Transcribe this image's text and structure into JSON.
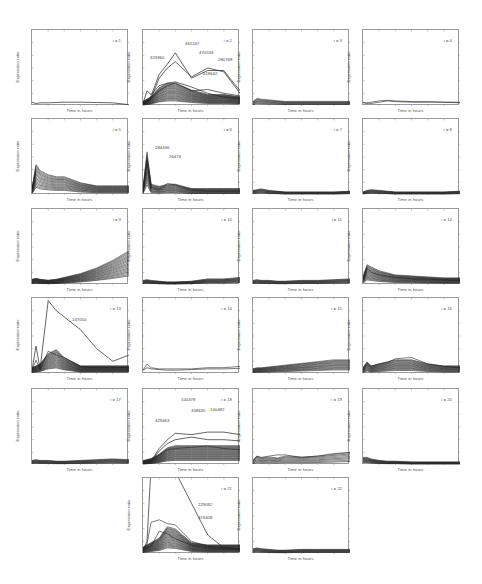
{
  "figure": {
    "ylabel": "Expression ratio",
    "xlabel": "Time in hours"
  },
  "chart_data": [
    {
      "type": "line",
      "title": "i = 1",
      "xlabel": "Time in hours",
      "ylabel": "Expression ratio",
      "ylim": [
        0,
        6
      ],
      "grid": false,
      "annotations": [],
      "series_desc": "single near-flat profile ~0.3"
    },
    {
      "type": "line",
      "title": "i = 2",
      "xlabel": "Time in hours",
      "ylabel": "Expression ratio",
      "ylim": [
        0,
        6
      ],
      "grid": false,
      "annotations": [
        "323960",
        "361247",
        "470534",
        "280768",
        "618642"
      ],
      "series_desc": "dense bundle rising to peak ~hour 3 then declining; outliers peaking ~4.2"
    },
    {
      "type": "line",
      "title": "i = 3",
      "xlabel": "Time in hours",
      "ylabel": "Expression ratio",
      "ylim": [
        0,
        6
      ],
      "grid": false,
      "annotations": [],
      "series_desc": "flat bundle ~0.3"
    },
    {
      "type": "line",
      "title": "i = 4",
      "xlabel": "Time in hours",
      "ylabel": "Expression ratio",
      "ylim": [
        0,
        6
      ],
      "grid": false,
      "annotations": [],
      "series_desc": "flat ~0.3"
    },
    {
      "type": "line",
      "title": "i = 5",
      "xlabel": "Time in hours",
      "ylabel": "Expression ratio",
      "ylim": [
        0,
        6
      ],
      "grid": false,
      "annotations": [],
      "series_desc": "early peak ~1.5 then decay"
    },
    {
      "type": "line",
      "title": "i = 6",
      "xlabel": "Time in hours",
      "ylabel": "Expression ratio",
      "ylim": [
        0,
        6
      ],
      "grid": false,
      "annotations": [
        "284436",
        "26474"
      ],
      "series_desc": "sharp early spike ~2.5 then flat"
    },
    {
      "type": "line",
      "title": "i = 7",
      "xlabel": "Time in hours",
      "ylabel": "Expression ratio",
      "ylim": [
        0,
        6
      ],
      "grid": false,
      "annotations": [],
      "series_desc": "flat ~0.3"
    },
    {
      "type": "line",
      "title": "i = 8",
      "xlabel": "Time in hours",
      "ylabel": "Expression ratio",
      "ylim": [
        0,
        6
      ],
      "grid": false,
      "annotations": [],
      "series_desc": "flat ~0.3"
    },
    {
      "type": "line",
      "title": "i = 9",
      "xlabel": "Time in hours",
      "ylabel": "Expression ratio",
      "ylim": [
        0,
        6
      ],
      "grid": false,
      "annotations": [],
      "series_desc": "late rising fan up to ~2"
    },
    {
      "type": "line",
      "title": "i = 10",
      "xlabel": "Time in hours",
      "ylabel": "Expression ratio",
      "ylim": [
        0,
        6
      ],
      "grid": false,
      "annotations": [],
      "series_desc": "flat ~0.3"
    },
    {
      "type": "line",
      "title": "i = 11",
      "xlabel": "Time in hours",
      "ylabel": "Expression ratio",
      "ylim": [
        0,
        6
      ],
      "grid": false,
      "annotations": [],
      "series_desc": "flat ~0.3"
    },
    {
      "type": "line",
      "title": "i = 12",
      "xlabel": "Time in hours",
      "ylabel": "Expression ratio",
      "ylim": [
        0,
        6
      ],
      "grid": false,
      "annotations": [],
      "series_desc": "early high ~1.3 then slow decay"
    },
    {
      "type": "line",
      "title": "i = 13",
      "xlabel": "Time in hours",
      "ylabel": "Expression ratio",
      "ylim": [
        0,
        6
      ],
      "grid": false,
      "annotations": [
        "147050"
      ],
      "series_desc": "outlier spike ~5.8 at hour ~1 then decline; bundle peak ~1.5"
    },
    {
      "type": "line",
      "title": "i = 14",
      "xlabel": "Time in hours",
      "ylabel": "Expression ratio",
      "ylim": [
        0,
        6
      ],
      "grid": false,
      "annotations": [],
      "series_desc": "few low flat profiles ~0.4"
    },
    {
      "type": "line",
      "title": "i = 15",
      "xlabel": "Time in hours",
      "ylabel": "Expression ratio",
      "ylim": [
        0,
        6
      ],
      "grid": false,
      "annotations": [],
      "series_desc": "low slowly rising ~0.3-0.7"
    },
    {
      "type": "line",
      "title": "i = 16",
      "xlabel": "Time in hours",
      "ylabel": "Expression ratio",
      "ylim": [
        0,
        6
      ],
      "grid": false,
      "annotations": [],
      "series_desc": "bump ~1 at mid time"
    },
    {
      "type": "line",
      "title": "i = 17",
      "xlabel": "Time in hours",
      "ylabel": "Expression ratio",
      "ylim": [
        0,
        6
      ],
      "grid": false,
      "annotations": [],
      "series_desc": "flat ~0.3"
    },
    {
      "type": "line",
      "title": "i = 18",
      "xlabel": "Time in hours",
      "ylabel": "Expression ratio",
      "ylim": [
        0,
        6
      ],
      "grid": false,
      "annotations": [
        "100478",
        "429463",
        "358635",
        "100482"
      ],
      "series_desc": "bundle rising and plateauing; outliers ~2.5"
    },
    {
      "type": "line",
      "title": "i = 19",
      "xlabel": "Time in hours",
      "ylabel": "Expression ratio",
      "ylim": [
        0,
        6
      ],
      "grid": false,
      "annotations": [],
      "series_desc": "low wavy ~0.3-0.8"
    },
    {
      "type": "line",
      "title": "i = 20",
      "xlabel": "Time in hours",
      "ylabel": "Expression ratio",
      "ylim": [
        0,
        6
      ],
      "grid": false,
      "annotations": [],
      "series_desc": "flat ~0.3"
    },
    {
      "type": "line",
      "title": "i = 21",
      "xlabel": "Time in hours",
      "ylabel": "Expression ratio",
      "ylim": [
        0,
        6
      ],
      "grid": false,
      "annotations": [
        "229092",
        "313408"
      ],
      "series_desc": "extreme outlier off-scale; bundle peak ~1.5 mid"
    },
    {
      "type": "line",
      "title": "i = 22",
      "xlabel": "Time in hours",
      "ylabel": "Expression ratio",
      "ylim": [
        0,
        6
      ],
      "grid": false,
      "annotations": [],
      "series_desc": "flat ~0.3"
    }
  ],
  "panels": [
    {
      "label": "i = 1"
    },
    {
      "label": "i = 2"
    },
    {
      "label": "i = 3"
    },
    {
      "label": "i = 4"
    },
    {
      "label": "i = 5"
    },
    {
      "label": "i = 6"
    },
    {
      "label": "i = 7"
    },
    {
      "label": "i = 8"
    },
    {
      "label": "i = 9"
    },
    {
      "label": "i = 10"
    },
    {
      "label": "i = 11"
    },
    {
      "label": "i = 12"
    },
    {
      "label": "i = 13"
    },
    {
      "label": "i = 14"
    },
    {
      "label": "i = 15"
    },
    {
      "label": "i = 16"
    },
    {
      "label": "i = 17"
    },
    {
      "label": "i = 18"
    },
    {
      "label": "i = 19"
    },
    {
      "label": "i = 20"
    },
    {
      "label": "i = 21"
    },
    {
      "label": "i = 22"
    }
  ],
  "annotations": {
    "p2": [
      "323960",
      "361247",
      "470534",
      "280768",
      "618642"
    ],
    "p6": [
      "284436",
      "26474"
    ],
    "p13": [
      "147050"
    ],
    "p18": [
      "100478",
      "429463",
      "358635",
      "100482"
    ],
    "p21": [
      "229092",
      "313408"
    ]
  }
}
